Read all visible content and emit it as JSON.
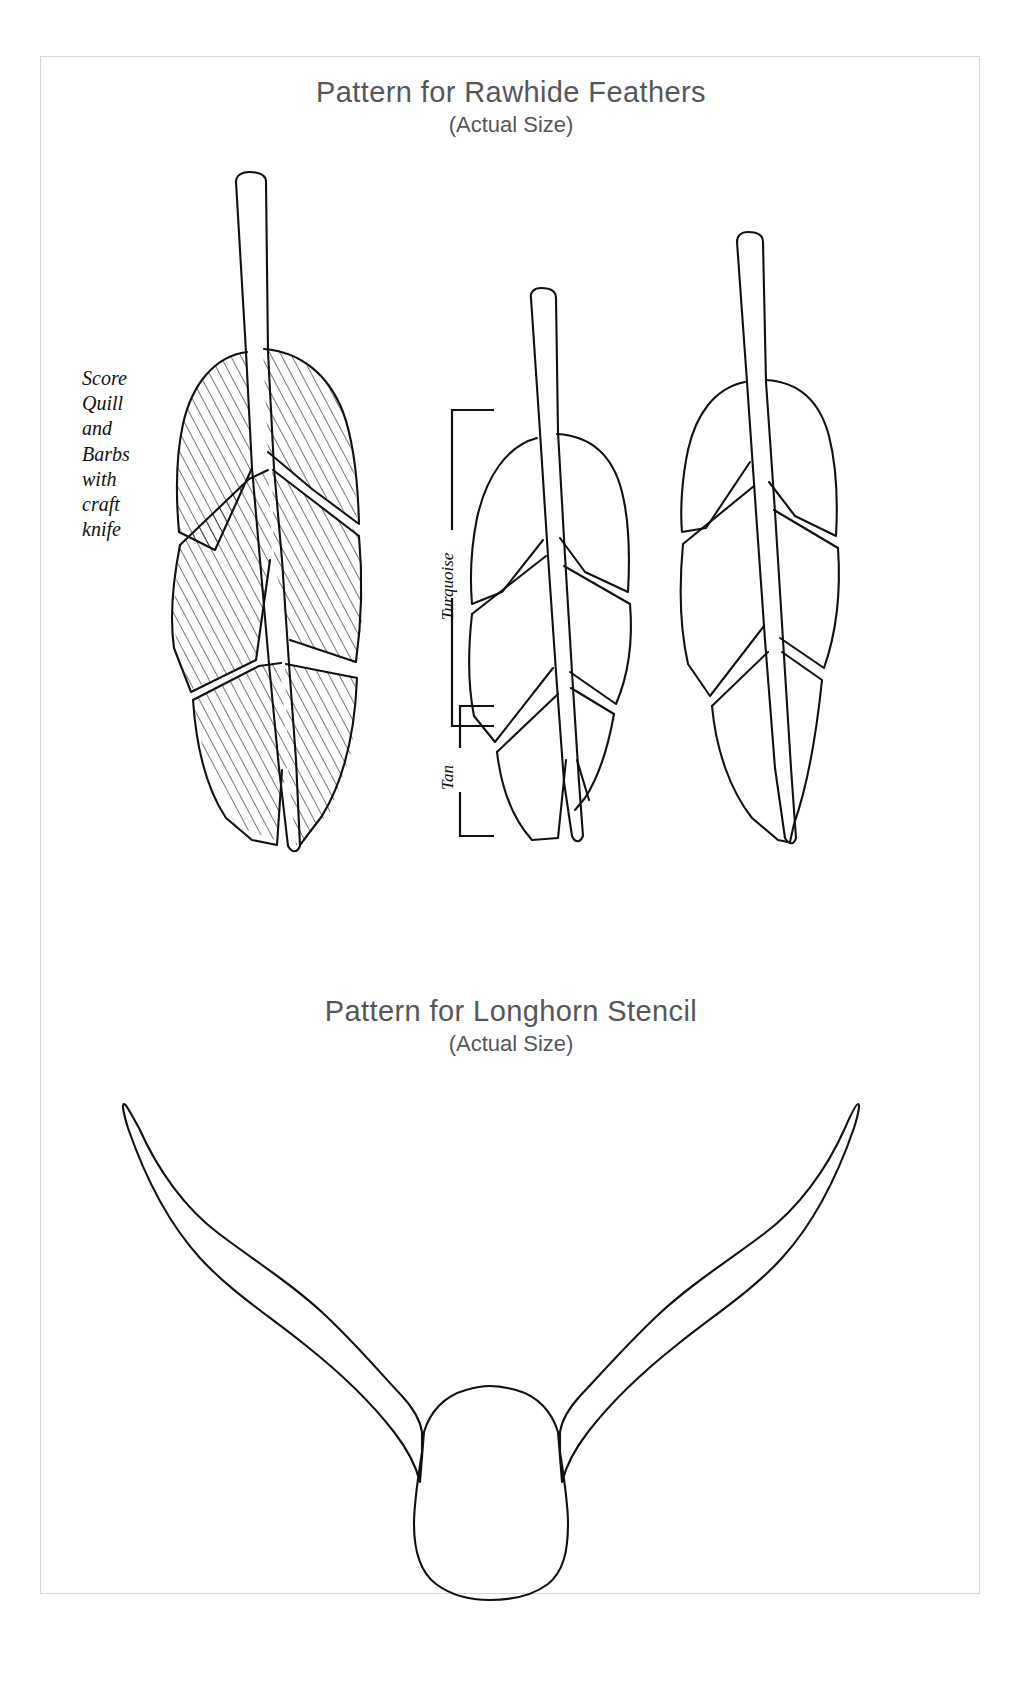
{
  "page": {
    "background_color": "#ffffff",
    "border_color": "#d6d6d6",
    "ink_color": "#111111",
    "heading_color": "#55565a"
  },
  "sections": [
    {
      "id": "feathers",
      "title": "Pattern for Rawhide Feathers",
      "subtitle": "(Actual Size)"
    },
    {
      "id": "longhorn",
      "title": "Pattern for Longhorn Stencil",
      "subtitle": "(Actual Size)"
    }
  ],
  "feather_section": {
    "title": "Pattern for Rawhide Feathers",
    "subtitle": "(Actual Size)",
    "instruction_note": "Score\nQuill\nand\nBarbs\nwith\ncraft\nknife",
    "color_labels": [
      {
        "text": "Turquoise",
        "orientation": "vertical-rotated-90"
      },
      {
        "text": "Tan",
        "orientation": "vertical-rotated-90"
      }
    ],
    "feathers": [
      {
        "name": "feather-left-hatched",
        "style": "hatched",
        "segments": 3
      },
      {
        "name": "feather-middle-outline",
        "style": "outline",
        "segments": 4
      },
      {
        "name": "feather-right-outline",
        "style": "outline",
        "segments": 3
      }
    ]
  },
  "longhorn_section": {
    "title": "Pattern for Longhorn Stencil",
    "subtitle": "(Actual Size)",
    "shape_name": "longhorn-skull-silhouette"
  }
}
